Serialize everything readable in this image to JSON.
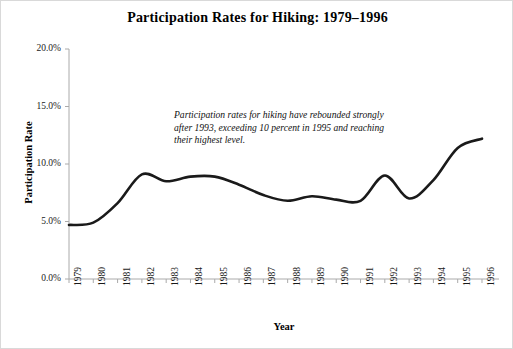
{
  "chart_data": {
    "type": "line",
    "title": "Participation Rates for Hiking: 1979–1996",
    "xlabel": "Year",
    "ylabel": "Participation Rate",
    "grid": false,
    "legend": null,
    "ylim": [
      0,
      20
    ],
    "ytick_labels": [
      "0.0%",
      "5.0%",
      "10.0%",
      "15.0%",
      "20.0%"
    ],
    "ytick_values": [
      0,
      5,
      10,
      15,
      20
    ],
    "categories": [
      "1979",
      "1980",
      "1981",
      "1982",
      "1983",
      "1984",
      "1985",
      "1986",
      "1987",
      "1988",
      "1989",
      "1990",
      "1991",
      "1992",
      "1993",
      "1994",
      "1995",
      "1996"
    ],
    "values": [
      4.7,
      4.9,
      6.6,
      9.1,
      8.5,
      8.9,
      8.9,
      8.2,
      7.3,
      6.8,
      7.2,
      6.9,
      6.8,
      9.0,
      7.0,
      8.6,
      11.4,
      12.2
    ],
    "series_color": "#1a1a1a",
    "annotation": "Participation rates for hiking have rebounded strongly after 1993, exceeding 10 percent in 1995 and reaching their highest level."
  }
}
